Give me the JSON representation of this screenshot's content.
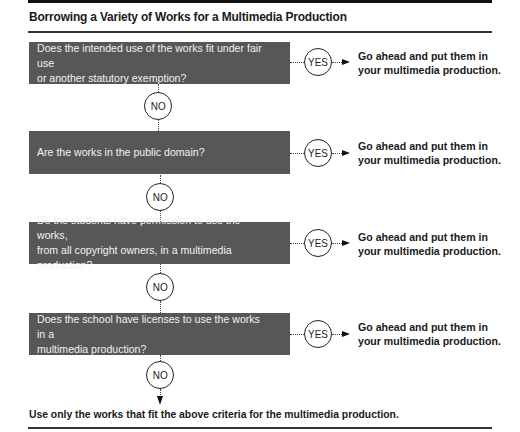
{
  "title": "Borrowing a Variety of Works for a Multimedia Production",
  "steps": [
    {
      "question": "Does the intended use of the works fit under fair use\nor another statutory exemption?",
      "yes_label": "YES",
      "yes_result": "Go ahead and put them in\nyour multimedia production.",
      "no_label": "NO"
    },
    {
      "question": "Are the works in the public domain?",
      "yes_label": "YES",
      "yes_result": "Go ahead and put them in\nyour multimedia production.",
      "no_label": "NO"
    },
    {
      "question": "Do the students have permission to use the works,\nfrom all copyright owners, in a multimedia production?",
      "yes_label": "YES",
      "yes_result": "Go ahead and put them in\nyour multimedia production.",
      "no_label": "NO"
    },
    {
      "question": "Does the school have licenses to use the works in a\nmultimedia production?",
      "yes_label": "YES",
      "yes_result": "Go ahead and put them in\nyour multimedia production.",
      "no_label": "NO"
    }
  ],
  "final_result": "Use only the works that fit the above criteria for the multimedia production.",
  "colors": {
    "question_box": "#575757",
    "question_text": "#f2f2f2",
    "text": "#1a1a1a"
  }
}
